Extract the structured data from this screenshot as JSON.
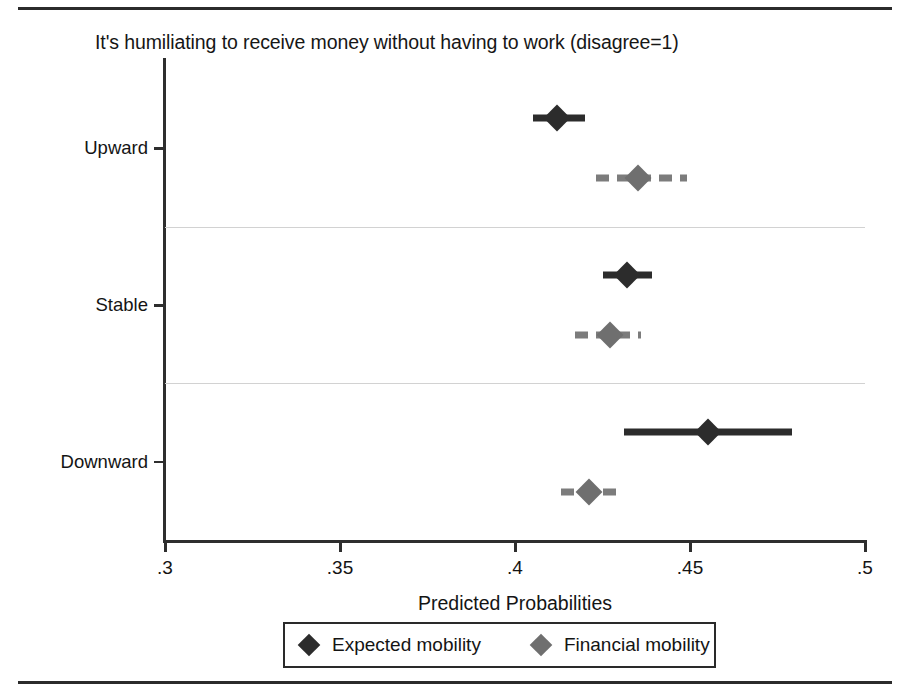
{
  "figure": {
    "title": "It's humiliating to receive money without having to work (disagree=1)"
  },
  "axes": {
    "x_title": "Predicted Probabilities",
    "x_ticks": [
      ".3",
      ".35",
      ".4",
      ".45",
      ".5"
    ],
    "y_categories": [
      "Upward",
      "Stable",
      "Downward"
    ]
  },
  "legend": {
    "items": [
      {
        "label": "Expected mobility",
        "color": "#2c2c2c",
        "style": "solid"
      },
      {
        "label": "Financial mobility",
        "color": "#6f6f6f",
        "style": "dashed"
      }
    ]
  },
  "chart_data": {
    "type": "scatter",
    "title": "It's humiliating to receive money without having to work (disagree=1)",
    "subtitle": "",
    "xlabel": "Predicted Probabilities",
    "ylabel": "",
    "xlim": [
      0.3,
      0.5
    ],
    "xticks": [
      0.3,
      0.35,
      0.4,
      0.45,
      0.5
    ],
    "xticklabels": [
      ".3",
      ".35",
      ".4",
      ".45",
      ".5"
    ],
    "categories": [
      "Upward",
      "Stable",
      "Downward"
    ],
    "grid": "horizontal-separators-between-categories",
    "legend_position": "below-axis-centered",
    "series": [
      {
        "name": "Expected mobility",
        "color": "#2c2c2c",
        "marker": "diamond",
        "ci_style": "solid",
        "points": [
          {
            "category": "Upward",
            "value": 0.412,
            "ci_low": 0.405,
            "ci_high": 0.42
          },
          {
            "category": "Stable",
            "value": 0.432,
            "ci_low": 0.425,
            "ci_high": 0.439
          },
          {
            "category": "Downward",
            "value": 0.455,
            "ci_low": 0.431,
            "ci_high": 0.479
          }
        ]
      },
      {
        "name": "Financial mobility",
        "color": "#6f6f6f",
        "marker": "diamond",
        "ci_style": "dashed",
        "points": [
          {
            "category": "Upward",
            "value": 0.435,
            "ci_low": 0.423,
            "ci_high": 0.449
          },
          {
            "category": "Stable",
            "value": 0.427,
            "ci_low": 0.417,
            "ci_high": 0.436
          },
          {
            "category": "Downward",
            "value": 0.421,
            "ci_low": 0.413,
            "ci_high": 0.429
          }
        ]
      }
    ]
  }
}
